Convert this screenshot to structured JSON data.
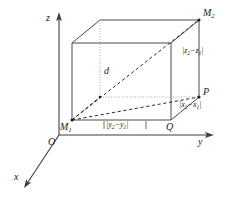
{
  "figure": {
    "type": "geometry-diagram",
    "background_color": "#ffffff",
    "line_color": "#3d3d3d",
    "text_color": "#1a1a1a"
  },
  "axes": {
    "z": {
      "label": "z",
      "direction": "up"
    },
    "y": {
      "label": "y",
      "direction": "right"
    },
    "x": {
      "label": "x",
      "direction": "down-left"
    },
    "origin": {
      "label": "O"
    }
  },
  "points": {
    "m1": {
      "label": "M",
      "sub": "1"
    },
    "m2": {
      "label": "M",
      "sub": "2"
    },
    "p": {
      "label": "P"
    },
    "q": {
      "label": "Q"
    }
  },
  "segments": {
    "diagonal": {
      "label": "d"
    },
    "edge_y": {
      "open": "|",
      "a": "y",
      "a_sub": "2",
      "minus": "−",
      "b": "y",
      "b_sub": "1",
      "close": "|"
    },
    "edge_x": {
      "open": "|",
      "a": "x",
      "a_sub": "2",
      "minus": "−",
      "b": "x",
      "b_sub": "1",
      "close": "|"
    },
    "edge_z": {
      "open": "|",
      "a": "z",
      "a_sub": "2",
      "minus": "−",
      "b": "z",
      "b_sub": "1",
      "close": "|"
    }
  }
}
